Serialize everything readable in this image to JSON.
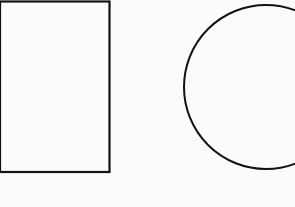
{
  "diagram": {
    "background": "#fbfbfa",
    "stroke": "#111111",
    "shapes": [
      {
        "type": "rectangle",
        "x": 0,
        "y": 1.5,
        "width": 109.5,
        "height": 170.5,
        "stroke_width": 2.2
      },
      {
        "type": "circle",
        "cx": 266,
        "cy": 87,
        "r": 82,
        "stroke_width": 2
      }
    ]
  }
}
